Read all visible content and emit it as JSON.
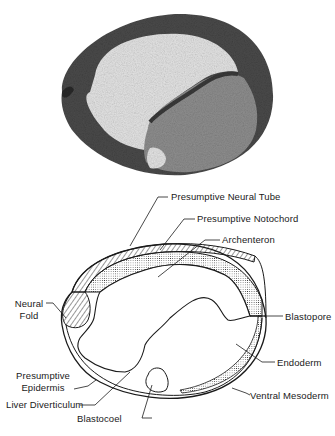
{
  "figure": {
    "micrograph": {
      "description": "photomicrograph-section-of-embryo",
      "colors": {
        "tissue_dark": "#3a3a3a",
        "tissue_mid": "#7a7a7a",
        "yolk": "#9a9a9a",
        "cavity": "#e6e6e6"
      }
    },
    "diagram": {
      "labels": {
        "neural_tube": "Presumptive Neural Tube",
        "notochord": "Presumptive Notochord",
        "archenteron": "Archenteron",
        "neural_fold_1": "Neural",
        "neural_fold_2": "Fold",
        "blastopore": "Blastopore",
        "endoderm": "Endoderm",
        "epidermis_1": "Presumptive",
        "epidermis_2": "Epidermis",
        "liver": "Liver Diverticulum",
        "mesoderm": "Ventral Mesoderm",
        "blastocoel": "Blastocoel"
      },
      "colors": {
        "line": "#1a1a1a",
        "background": "#ffffff"
      }
    }
  }
}
